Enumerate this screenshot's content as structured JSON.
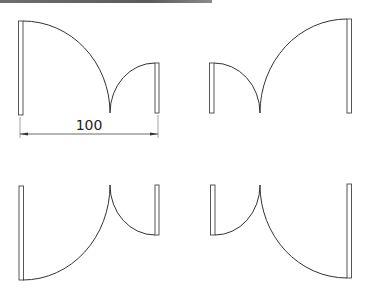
{
  "diagram": {
    "type": "double-door unequal leaf plan symbols",
    "colors": {
      "line": "#333333",
      "leaf_fill": "#ffffff",
      "topbar": "#5a5a5a"
    },
    "dimension": {
      "label": "100",
      "span": "full opening width (top-left variant)"
    },
    "variants": [
      {
        "name": "top-left",
        "description": "large leaf hinged left, small leaf hinged right, swing upward"
      },
      {
        "name": "top-right",
        "description": "small leaf hinged left, large leaf hinged right, swing upward"
      },
      {
        "name": "bottom-left",
        "description": "large leaf hinged left, small leaf hinged right, swing downward"
      },
      {
        "name": "bottom-right",
        "description": "small leaf hinged left, large leaf hinged right, swing downward"
      }
    ]
  }
}
